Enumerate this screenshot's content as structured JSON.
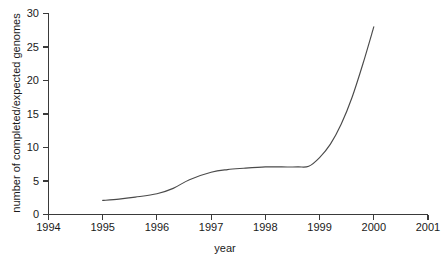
{
  "chart_data": {
    "type": "line",
    "title": "",
    "xlabel": "year",
    "ylabel": "number of completed/expected genomes",
    "xlim": [
      1994,
      2001
    ],
    "ylim": [
      0,
      30
    ],
    "grid": false,
    "legend": null,
    "x_ticks": [
      "1994",
      "1995",
      "1996",
      "1997",
      "1998",
      "1999",
      "2000",
      "2001"
    ],
    "y_ticks": [
      "0",
      "5",
      "10",
      "15",
      "20",
      "25",
      "30"
    ],
    "series": [
      {
        "name": "completed/expected genomes",
        "color": "#4a4a4a",
        "x": [
          1995.0,
          1995.3,
          1995.6,
          1996.0,
          1996.3,
          1996.6,
          1997.0,
          1997.3,
          1997.6,
          1998.0,
          1998.3,
          1998.6,
          1998.8,
          1999.0,
          1999.2,
          1999.4,
          1999.6,
          1999.8,
          2000.0
        ],
        "y": [
          2.1,
          2.3,
          2.6,
          3.1,
          3.9,
          5.2,
          6.3,
          6.7,
          6.9,
          7.1,
          7.1,
          7.1,
          7.2,
          8.5,
          10.5,
          13.5,
          17.5,
          22.5,
          28.0
        ]
      }
    ]
  },
  "axis_labels": {
    "x_title": "year",
    "y_title": "number of completed/expected genomes"
  },
  "colors": {
    "line": "#4a4a4a",
    "axis": "#3a3a3a",
    "text": "#1a1a1a",
    "background": "#ffffff"
  }
}
